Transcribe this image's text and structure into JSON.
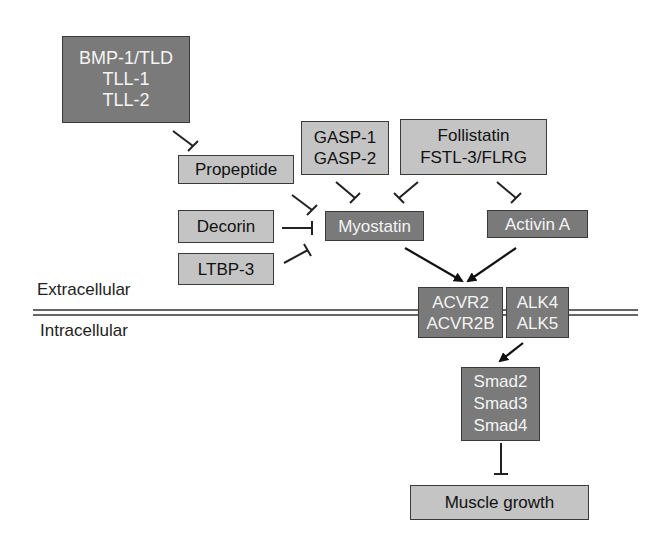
{
  "diagram": {
    "regions": {
      "extracellular": "Extracellular",
      "intracellular": "Intracellular"
    },
    "nodes": {
      "bmp": {
        "lines": [
          "BMP-1/TLD",
          "TLL-1",
          "TLL-2"
        ],
        "style": "dark"
      },
      "propeptide": {
        "lines": [
          "Propeptide"
        ],
        "style": "light"
      },
      "gasp": {
        "lines": [
          "GASP-1",
          "GASP-2"
        ],
        "style": "light"
      },
      "follistatin": {
        "lines": [
          "Follistatin",
          "FSTL-3/FLRG"
        ],
        "style": "light"
      },
      "decorin": {
        "lines": [
          "Decorin"
        ],
        "style": "light"
      },
      "ltbp3": {
        "lines": [
          "LTBP-3"
        ],
        "style": "light"
      },
      "myostatin": {
        "lines": [
          "Myostatin"
        ],
        "style": "dark"
      },
      "activin": {
        "lines": [
          "Activin A"
        ],
        "style": "dark"
      },
      "acvr2": {
        "lines": [
          "ACVR2",
          "ACVR2B"
        ],
        "style": "dark"
      },
      "alk": {
        "lines": [
          "ALK4",
          "ALK5"
        ],
        "style": "dark"
      },
      "smad": {
        "lines": [
          "Smad2",
          "Smad3",
          "Smad4"
        ],
        "style": "dark"
      },
      "muscle": {
        "lines": [
          "Muscle growth"
        ],
        "style": "light"
      }
    },
    "edges": [
      {
        "from": "bmp",
        "to": "propeptide",
        "type": "inhibit"
      },
      {
        "from": "propeptide",
        "to": "myostatin",
        "type": "inhibit"
      },
      {
        "from": "decorin",
        "to": "myostatin",
        "type": "inhibit"
      },
      {
        "from": "ltbp3",
        "to": "myostatin",
        "type": "inhibit"
      },
      {
        "from": "gasp",
        "to": "myostatin",
        "type": "inhibit"
      },
      {
        "from": "follistatin",
        "to": "myostatin",
        "type": "inhibit"
      },
      {
        "from": "follistatin",
        "to": "activin",
        "type": "inhibit"
      },
      {
        "from": "myostatin",
        "to": "acvr2",
        "type": "activate"
      },
      {
        "from": "activin",
        "to": "acvr2",
        "type": "activate"
      },
      {
        "from": "alk",
        "to": "smad",
        "type": "activate"
      },
      {
        "from": "smad",
        "to": "muscle",
        "type": "inhibit"
      }
    ],
    "colors": {
      "dark_box": "#7a7a7a",
      "light_box": "#c4c4c4",
      "line": "#222222"
    }
  }
}
